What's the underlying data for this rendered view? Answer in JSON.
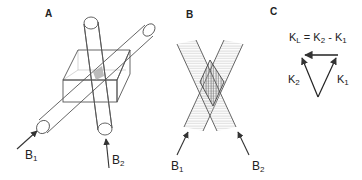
{
  "panels": {
    "a": {
      "label": "A",
      "beams": [
        {
          "name": "B",
          "sub": "1"
        },
        {
          "name": "B",
          "sub": "2"
        }
      ]
    },
    "b": {
      "label": "B",
      "beams": [
        {
          "name": "B",
          "sub": "1"
        },
        {
          "name": "B",
          "sub": "2"
        }
      ]
    },
    "c": {
      "label": "C",
      "equation": {
        "lhs": "K",
        "lhs_sub": "L",
        "eq": " = ",
        "t1": "K",
        "t1_sub": "2",
        "minus": " - ",
        "t2": "K",
        "t2_sub": "1"
      },
      "vectors": [
        {
          "name": "K",
          "sub": "2"
        },
        {
          "name": "K",
          "sub": "1"
        }
      ]
    }
  },
  "colors": {
    "line": "#444444",
    "hatch": "#bbbbbb",
    "overlap": "#999999"
  }
}
